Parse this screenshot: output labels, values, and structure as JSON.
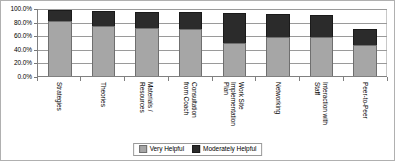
{
  "chart_data": {
    "type": "bar",
    "stacked": true,
    "title": "",
    "xlabel": "",
    "ylabel": "",
    "ylim": [
      0,
      100
    ],
    "ytick_labels": [
      "100.0%",
      "80.0%",
      "60.0%",
      "40.0%",
      "20.0%",
      "0.0%"
    ],
    "ytick_values": [
      100,
      80,
      60,
      40,
      20,
      0
    ],
    "grid": true,
    "legend_position": "bottom-center",
    "categories": [
      "Strategies",
      "Theories",
      "Materials / Resources",
      "Consultation from Coach",
      "Work Site Implementation Plan",
      "Networking",
      "Interaction with Staff",
      "Peer-to-Peer"
    ],
    "category_lines": [
      [
        "Strategies"
      ],
      [
        "Theories"
      ],
      [
        "Materials /",
        "Resources"
      ],
      [
        "Consultation",
        "from Coach"
      ],
      [
        "Work Site",
        "Implementation",
        "Plan"
      ],
      [
        "Networking"
      ],
      [
        "Interaction with",
        "Staff"
      ],
      [
        "Peer-to-Peer"
      ]
    ],
    "series": [
      {
        "name": "Very Helpful",
        "color": "#a6a6a6",
        "values": [
          81,
          73,
          71,
          69,
          49,
          57,
          57,
          46
        ]
      },
      {
        "name": "Moderately Helpful",
        "color": "#2b2b2b",
        "values": [
          16,
          23,
          23,
          25,
          43,
          34,
          33,
          23
        ]
      }
    ],
    "totals": [
      97,
      96,
      94,
      94,
      92,
      91,
      90,
      69
    ]
  },
  "legend": {
    "entries": [
      {
        "label": "Very Helpful"
      },
      {
        "label": "Moderately Helpful"
      }
    ]
  }
}
